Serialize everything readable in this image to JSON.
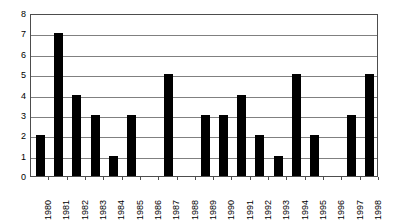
{
  "chart_data": {
    "type": "bar",
    "title": "",
    "subtitle": "",
    "xlabel": "",
    "ylabel": "",
    "categories": [
      "1980",
      "1981",
      "1982",
      "1983",
      "1984",
      "1985",
      "1986",
      "1987",
      "1988",
      "1989",
      "1990",
      "1991",
      "1992",
      "1993",
      "1994",
      "1995",
      "1996",
      "1997",
      "1998"
    ],
    "values": [
      2,
      7,
      4,
      3,
      1,
      3,
      0,
      5,
      0,
      3,
      3,
      4,
      2,
      1,
      5,
      2,
      0,
      3,
      5
    ],
    "ylim": [
      0,
      8
    ],
    "y_ticks": [
      "0",
      "1",
      "2",
      "3",
      "4",
      "5",
      "6",
      "7",
      "8"
    ],
    "y_tick_values": [
      0,
      1,
      2,
      3,
      4,
      5,
      6,
      7,
      8
    ],
    "grid": true,
    "grid_axis": "y",
    "legend": false,
    "legend_position": "none",
    "annotations": [],
    "colors": {
      "bar": "#000000",
      "gridline": "#808080",
      "frame": "#4d4d4d",
      "background": "#ffffff",
      "text": "#000000"
    },
    "x_tick_label_rotation": -90
  }
}
